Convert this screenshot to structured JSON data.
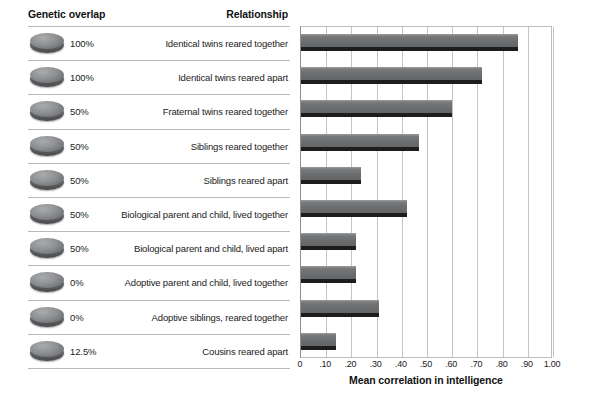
{
  "table": {
    "headers": {
      "genetic_overlap": "Genetic overlap",
      "relationship": "Relationship"
    },
    "rows": [
      {
        "overlap": "100%",
        "relationship": "Identical twins reared together"
      },
      {
        "overlap": "100%",
        "relationship": "Identical twins reared apart"
      },
      {
        "overlap": "50%",
        "relationship": "Fraternal twins reared together"
      },
      {
        "overlap": "50%",
        "relationship": "Siblings reared together"
      },
      {
        "overlap": "50%",
        "relationship": "Siblings reared apart"
      },
      {
        "overlap": "50%",
        "relationship": "Biological parent and child, lived together"
      },
      {
        "overlap": "50%",
        "relationship": "Biological parent and child, lived apart"
      },
      {
        "overlap": "0%",
        "relationship": "Adoptive parent and child, lived together"
      },
      {
        "overlap": "0%",
        "relationship": "Adoptive siblings, reared together"
      },
      {
        "overlap": "12.5%",
        "relationship": "Cousins reared apart"
      }
    ]
  },
  "chart_data": {
    "type": "bar",
    "orientation": "horizontal",
    "title": "",
    "xlabel": "Mean correlation in intelligence",
    "ylabel": "",
    "xlim": [
      0,
      1.0
    ],
    "grid": true,
    "legend": "none",
    "tick_labels": [
      "0",
      ".10",
      ".20",
      ".30",
      ".40",
      ".50",
      ".60",
      ".70",
      ".80",
      ".90",
      "1.00"
    ],
    "tick_values": [
      0,
      0.1,
      0.2,
      0.3,
      0.4,
      0.5,
      0.6,
      0.7,
      0.8,
      0.9,
      1.0
    ],
    "categories": [
      "Identical twins reared together",
      "Identical twins reared apart",
      "Fraternal twins reared together",
      "Siblings reared together",
      "Siblings reared apart",
      "Biological parent and child, lived together",
      "Biological parent and child, lived apart",
      "Adoptive parent and child, lived together",
      "Adoptive siblings, reared together",
      "Cousins reared apart"
    ],
    "values": [
      0.86,
      0.72,
      0.6,
      0.47,
      0.24,
      0.42,
      0.22,
      0.22,
      0.31,
      0.14
    ],
    "colors": {
      "bar_face": "#6f7173",
      "bar_base": "#1d1d1d",
      "gridline": "#c4c4c4",
      "text": "#1b1b1b",
      "background": "#ffffff"
    }
  }
}
